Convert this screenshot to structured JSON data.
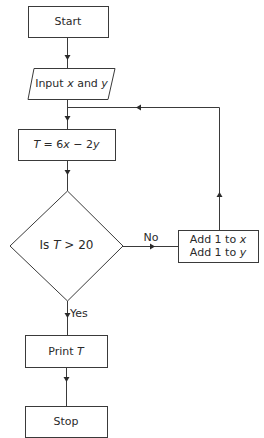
{
  "flowchart": {
    "nodes": {
      "start": {
        "type": "terminal",
        "label": "Start"
      },
      "input": {
        "type": "input",
        "label_prefix": "Input ",
        "var1": "x",
        "mid": " and ",
        "var2": "y"
      },
      "compute": {
        "type": "process",
        "label": "T = 6x − 2y",
        "lhs": "T",
        "eq": " = 6",
        "v1": "x",
        "minus": " − 2",
        "v2": "y"
      },
      "decision": {
        "type": "decision",
        "prefix": "Is ",
        "var": "T",
        "cond": " > 20"
      },
      "increment": {
        "type": "process",
        "line1_prefix": "Add 1 to ",
        "line1_var": "x",
        "line2_prefix": "Add 1 to ",
        "line2_var": "y"
      },
      "print": {
        "type": "output",
        "prefix": "Print ",
        "var": "T"
      },
      "stop": {
        "type": "terminal",
        "label": "Stop"
      }
    },
    "edges": {
      "no_label": "No",
      "yes_label": "Yes"
    }
  }
}
